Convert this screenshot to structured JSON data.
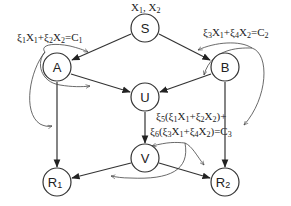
{
  "diagram": {
    "source_label": "X1, X2",
    "nodes": [
      {
        "id": "S",
        "label": "S",
        "sub": ""
      },
      {
        "id": "A",
        "label": "A",
        "sub": ""
      },
      {
        "id": "B",
        "label": "B",
        "sub": ""
      },
      {
        "id": "U",
        "label": "U",
        "sub": ""
      },
      {
        "id": "V",
        "label": "V",
        "sub": ""
      },
      {
        "id": "R1",
        "label": "R",
        "sub": "1"
      },
      {
        "id": "R2",
        "label": "R",
        "sub": "2"
      }
    ],
    "edges": [
      {
        "from": "S",
        "to": "A"
      },
      {
        "from": "S",
        "to": "B"
      },
      {
        "from": "A",
        "to": "U"
      },
      {
        "from": "B",
        "to": "U"
      },
      {
        "from": "A",
        "to": "R1"
      },
      {
        "from": "B",
        "to": "R2"
      },
      {
        "from": "U",
        "to": "V"
      },
      {
        "from": "V",
        "to": "R1"
      },
      {
        "from": "V",
        "to": "R2"
      }
    ],
    "equations": {
      "A": "ξ1X1+ξ2X2=C1",
      "B": "ξ3X1+ξ4X2=C2",
      "V_line1": "ξ5(ξ1X1+ξ2X2)+",
      "V_line2": "ξ6(ξ3X1+ξ4X2)=C3"
    }
  }
}
